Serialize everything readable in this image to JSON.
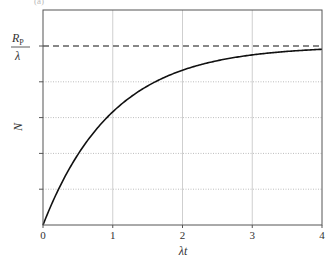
{
  "chart_data": {
    "type": "line",
    "title": "",
    "panel_label": "(a)",
    "xlabel": "λt",
    "ylabel": "N",
    "xlim": [
      0,
      4
    ],
    "ylim": [
      0,
      1.2
    ],
    "x_ticks": [
      0,
      1,
      2,
      3,
      4
    ],
    "x_tick_labels": [
      "0",
      "1",
      "2",
      "3",
      "4"
    ],
    "y_ticks": [
      0.2,
      0.4,
      0.6,
      0.8,
      1.0
    ],
    "y_tick_labels": [
      "",
      "",
      "",
      "",
      "R_P/λ"
    ],
    "grid": {
      "vertical": "solid light gray at x=1,2,3",
      "horizontal": "dotted light gray at y=0.2,0.4,0.6,0.8"
    },
    "legend": null,
    "series": [
      {
        "name": "N(t) = (R_P/λ)(1 − e^(−λt))",
        "style": "solid black",
        "x": [
          0,
          0.25,
          0.5,
          0.75,
          1.0,
          1.25,
          1.5,
          1.75,
          2.0,
          2.25,
          2.5,
          2.75,
          3.0,
          3.25,
          3.5,
          3.75,
          4.0
        ],
        "y": [
          0,
          0.221,
          0.393,
          0.528,
          0.632,
          0.713,
          0.777,
          0.826,
          0.865,
          0.895,
          0.918,
          0.936,
          0.95,
          0.961,
          0.97,
          0.976,
          0.982
        ]
      }
    ],
    "annotations": [
      {
        "type": "hline",
        "y": 1.0,
        "style": "dashed black",
        "label": "R_P/λ"
      }
    ]
  },
  "labels": {
    "ref_num": "R",
    "ref_sub": "P",
    "ref_den": "λ",
    "xlabel": "λt",
    "ylabel": "N",
    "panel": "(a)"
  }
}
